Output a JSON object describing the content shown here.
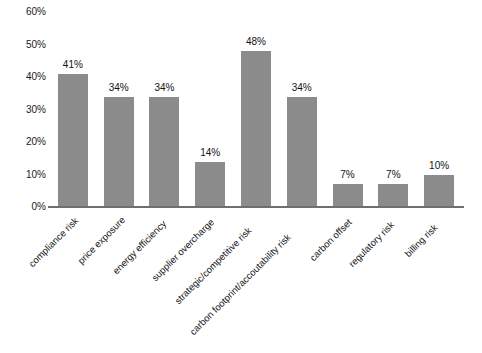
{
  "chart_data": {
    "type": "bar",
    "title": "",
    "subtitle": "",
    "xlabel": "",
    "ylabel": "",
    "ylim": [
      0,
      60
    ],
    "ytick_step": 10,
    "ytick_labels": [
      "60%",
      "50%",
      "40%",
      "30%",
      "20%",
      "10%",
      "0%"
    ],
    "ytick_values": [
      60,
      50,
      40,
      30,
      20,
      10,
      0
    ],
    "grid": false,
    "legend": null,
    "legend_position": "none",
    "value_label_suffix": "%",
    "categories": [
      "compliance risk",
      "price exposure",
      "energy efficiency",
      "supplier overcharge",
      "strategic/competitive risk",
      "carbon footprint/accoutability risk",
      "carbon offset",
      "regulatory risk",
      "billing risk"
    ],
    "values": [
      41,
      34,
      34,
      14,
      48,
      34,
      7,
      7,
      10
    ],
    "value_labels": [
      "41%",
      "34%",
      "34%",
      "14%",
      "48%",
      "34%",
      "7%",
      "7%",
      "10%"
    ],
    "bar_color": "#8b8b8b",
    "axis_color": "#6f6f6f",
    "text_color": "#151515",
    "background_color": "#ffffff"
  }
}
